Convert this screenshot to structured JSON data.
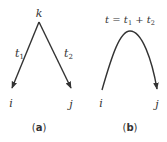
{
  "panel_a": {
    "top_node": "k",
    "left_node": "i",
    "right_node": "j",
    "left_edge": {
      "base": "t",
      "sub": "1"
    },
    "right_edge": {
      "base": "t",
      "sub": "2"
    },
    "caption_open": "(",
    "caption_letter": "a",
    "caption_close": ")"
  },
  "panel_b": {
    "formula": {
      "lhs": "t",
      "eq": " = ",
      "t1_base": "t",
      "t1_sub": "1",
      "plus": " + ",
      "t2_base": "t",
      "t2_sub": "2"
    },
    "left_node": "i",
    "right_node": "j",
    "caption_open": "(",
    "caption_letter": "b",
    "caption_close": ")"
  },
  "colors": {
    "stroke": "#333333",
    "background": "#ffffff"
  }
}
